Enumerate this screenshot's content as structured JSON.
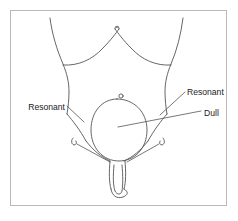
{
  "figure": {
    "frame": {
      "border_color": "#b9b9b9",
      "background_color": "#ffffff"
    },
    "line_color": "#555555",
    "text_color": "#1a1a1a"
  },
  "labels": [
    {
      "id": "resonant-left",
      "text": "Resonant",
      "side": "left",
      "x": 65,
      "y": 110,
      "anchor": "end",
      "leader": "M 67,112 L 84,122"
    },
    {
      "id": "resonant-right",
      "text": "Resonant",
      "side": "right",
      "x": 187,
      "y": 95,
      "anchor": "start",
      "leader": "M 185,92 L 162,112"
    },
    {
      "id": "dull",
      "text": "Dull",
      "side": "right",
      "x": 204,
      "y": 116,
      "anchor": "start",
      "leader": "M 200,111 L 118,127"
    }
  ],
  "anatomy": {
    "parts": [
      {
        "id": "costal-margin-left",
        "name": "left costal margin"
      },
      {
        "id": "costal-margin-right",
        "name": "right costal margin"
      },
      {
        "id": "xiphoid",
        "name": "xiphoid process notch"
      },
      {
        "id": "flank-left",
        "name": "left flank outline"
      },
      {
        "id": "flank-right",
        "name": "right flank outline"
      },
      {
        "id": "iliac-crest-left",
        "name": "left iliac crest line"
      },
      {
        "id": "iliac-crest-right",
        "name": "right iliac crest line"
      },
      {
        "id": "umbilicus",
        "name": "umbilicus"
      },
      {
        "id": "bladder",
        "name": "distended urinary bladder"
      },
      {
        "id": "inguinal-mark-left",
        "name": "left inguinal ring mark"
      },
      {
        "id": "inguinal-mark-right",
        "name": "right inguinal ring mark"
      },
      {
        "id": "inguinal-leader-left",
        "name": "left inguinal leader line"
      },
      {
        "id": "inguinal-leader-right",
        "name": "right inguinal leader line"
      },
      {
        "id": "penis",
        "name": "penis outline"
      },
      {
        "id": "glans",
        "name": "glans outline"
      }
    ]
  }
}
